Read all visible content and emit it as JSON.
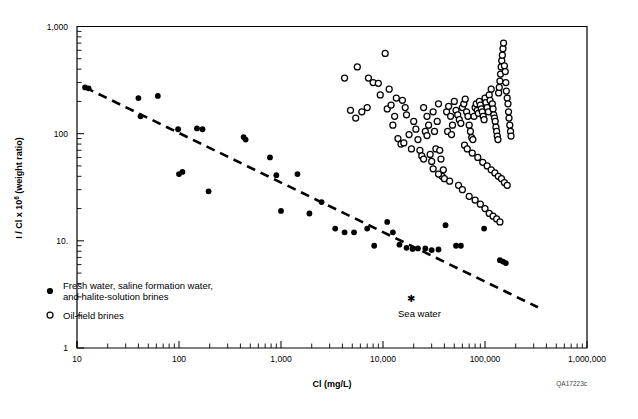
{
  "figure": {
    "id_label": "QA17223c",
    "background": "#ffffff",
    "ink": "#000000"
  },
  "chart_data": {
    "type": "scatter",
    "title": "",
    "xlabel": "Cl (mg/L)",
    "ylabel": "I / Cl x 10⁶ (weight ratio)",
    "xscale": "log",
    "yscale": "log",
    "xlim": [
      10,
      1000000
    ],
    "ylim": [
      1,
      1000
    ],
    "grid": false,
    "xticks": [
      10,
      100,
      1000,
      10000,
      100000,
      1000000
    ],
    "xticklabels": [
      "10",
      "100",
      "1,000",
      "10,000",
      "100,000",
      "1,000,000"
    ],
    "yticks": [
      1,
      10,
      100,
      1000
    ],
    "yticklabels": [
      "1",
      "10.",
      "100",
      "1,000"
    ],
    "legend_position": "lower-left-inside",
    "legend": [
      {
        "marker": "filled-circle",
        "label_line1": "Fresh water, saline formation water,",
        "label_line2": "and halite-solution brines"
      },
      {
        "marker": "open-circle",
        "label_line1": "Oil-field brines",
        "label_line2": ""
      }
    ],
    "annotations": [
      {
        "name": "sea-water",
        "text": "Sea water",
        "marker": "asterisk",
        "x": 19000,
        "y": 2.9
      }
    ],
    "trendline": {
      "style": "dashed",
      "x_start": 12,
      "y_start": 270,
      "x_end": 330000,
      "y_end": 2.4
    },
    "series": [
      {
        "name": "Fresh water, saline formation water, and halite-solution brines",
        "marker": "filled-circle",
        "points": [
          [
            12,
            270
          ],
          [
            13,
            265
          ],
          [
            40,
            215
          ],
          [
            42,
            145
          ],
          [
            62,
            225
          ],
          [
            98,
            110
          ],
          [
            100,
            42
          ],
          [
            108,
            44
          ],
          [
            150,
            112
          ],
          [
            170,
            110
          ],
          [
            195,
            29
          ],
          [
            430,
            93
          ],
          [
            450,
            88
          ],
          [
            780,
            60
          ],
          [
            900,
            41
          ],
          [
            1000,
            19
          ],
          [
            1450,
            42
          ],
          [
            1900,
            18
          ],
          [
            2500,
            23
          ],
          [
            3400,
            13
          ],
          [
            4200,
            12
          ],
          [
            5200,
            12
          ],
          [
            7000,
            13
          ],
          [
            8200,
            9.0
          ],
          [
            11000,
            15
          ],
          [
            12500,
            12
          ],
          [
            14500,
            9.2
          ],
          [
            17000,
            8.6
          ],
          [
            19500,
            8.4
          ],
          [
            22000,
            8.5
          ],
          [
            26000,
            8.5
          ],
          [
            30000,
            8.2
          ],
          [
            35000,
            8.3
          ],
          [
            41000,
            14
          ],
          [
            52000,
            9.0
          ],
          [
            58000,
            9.0
          ],
          [
            98000,
            13
          ],
          [
            140000,
            6.6
          ],
          [
            150000,
            6.4
          ],
          [
            160000,
            6.2
          ]
        ]
      },
      {
        "name": "Oil-field brines",
        "marker": "open-circle",
        "points": [
          [
            4200,
            330
          ],
          [
            5600,
            420
          ],
          [
            7200,
            330
          ],
          [
            8000,
            300
          ],
          [
            9000,
            295
          ],
          [
            9400,
            230
          ],
          [
            10500,
            560
          ],
          [
            11000,
            170
          ],
          [
            11500,
            260
          ],
          [
            12000,
            185
          ],
          [
            12500,
            120
          ],
          [
            13000,
            145
          ],
          [
            14000,
            90
          ],
          [
            15000,
            80
          ],
          [
            16000,
            82
          ],
          [
            17000,
            150
          ],
          [
            18000,
            98
          ],
          [
            19000,
            72
          ],
          [
            20000,
            130
          ],
          [
            21000,
            110
          ],
          [
            22000,
            88
          ],
          [
            23000,
            70
          ],
          [
            24000,
            62
          ],
          [
            25000,
            58
          ],
          [
            26000,
            105
          ],
          [
            27000,
            96
          ],
          [
            28000,
            120
          ],
          [
            29000,
            64
          ],
          [
            30000,
            55
          ],
          [
            31000,
            47
          ],
          [
            32000,
            105
          ],
          [
            33000,
            72
          ],
          [
            34000,
            130
          ],
          [
            35000,
            190
          ],
          [
            36000,
            70
          ],
          [
            37000,
            58
          ],
          [
            38000,
            40
          ],
          [
            39000,
            46
          ],
          [
            40000,
            38
          ],
          [
            42000,
            160
          ],
          [
            44000,
            180
          ],
          [
            46000,
            145
          ],
          [
            48000,
            120
          ],
          [
            50000,
            200
          ],
          [
            52000,
            165
          ],
          [
            54000,
            150
          ],
          [
            56000,
            135
          ],
          [
            58000,
            125
          ],
          [
            60000,
            175
          ],
          [
            62000,
            190
          ],
          [
            64000,
            210
          ],
          [
            66000,
            160
          ],
          [
            68000,
            145
          ],
          [
            70000,
            120
          ],
          [
            72000,
            105
          ],
          [
            74000,
            92
          ],
          [
            76000,
            88
          ],
          [
            78000,
            145
          ],
          [
            80000,
            175
          ],
          [
            82000,
            190
          ],
          [
            84000,
            165
          ],
          [
            86000,
            155
          ],
          [
            88000,
            200
          ],
          [
            90000,
            185
          ],
          [
            92000,
            170
          ],
          [
            94000,
            160
          ],
          [
            96000,
            145
          ],
          [
            98000,
            135
          ],
          [
            100000,
            215
          ],
          [
            102000,
            195
          ],
          [
            105000,
            175
          ],
          [
            108000,
            160
          ],
          [
            110000,
            230
          ],
          [
            112000,
            205
          ],
          [
            115000,
            260
          ],
          [
            118000,
            190
          ],
          [
            120000,
            170
          ],
          [
            122000,
            150
          ],
          [
            124000,
            140
          ],
          [
            126000,
            130
          ],
          [
            128000,
            115
          ],
          [
            130000,
            105
          ],
          [
            132000,
            95
          ],
          [
            134000,
            88
          ],
          [
            136000,
            240
          ],
          [
            138000,
            270
          ],
          [
            140000,
            310
          ],
          [
            142000,
            360
          ],
          [
            144000,
            420
          ],
          [
            146000,
            480
          ],
          [
            148000,
            540
          ],
          [
            150000,
            620
          ],
          [
            152000,
            700
          ],
          [
            155000,
            430
          ],
          [
            158000,
            380
          ],
          [
            160000,
            300
          ],
          [
            162000,
            250
          ],
          [
            165000,
            215
          ],
          [
            168000,
            190
          ],
          [
            170000,
            160
          ],
          [
            172000,
            140
          ],
          [
            175000,
            120
          ],
          [
            178000,
            105
          ],
          [
            180000,
            95
          ],
          [
            35000,
            42
          ],
          [
            45000,
            36
          ],
          [
            55000,
            33
          ],
          [
            60000,
            30
          ],
          [
            70000,
            26
          ],
          [
            80000,
            24
          ],
          [
            90000,
            22
          ],
          [
            100000,
            20
          ],
          [
            110000,
            18
          ],
          [
            120000,
            17
          ],
          [
            130000,
            16
          ],
          [
            140000,
            15
          ],
          [
            7000,
            175
          ],
          [
            6200,
            160
          ],
          [
            5400,
            140
          ],
          [
            4800,
            165
          ],
          [
            15500,
            205
          ],
          [
            16500,
            175
          ],
          [
            13500,
            215
          ],
          [
            25000,
            175
          ],
          [
            27000,
            145
          ],
          [
            31000,
            160
          ],
          [
            43000,
            105
          ],
          [
            47000,
            98
          ],
          [
            63000,
            78
          ],
          [
            67000,
            72
          ],
          [
            75000,
            66
          ],
          [
            85000,
            60
          ],
          [
            95000,
            54
          ],
          [
            105000,
            50
          ],
          [
            115000,
            46
          ],
          [
            125000,
            43
          ],
          [
            135000,
            40
          ],
          [
            145000,
            38
          ],
          [
            155000,
            35
          ],
          [
            165000,
            33
          ]
        ]
      }
    ]
  }
}
